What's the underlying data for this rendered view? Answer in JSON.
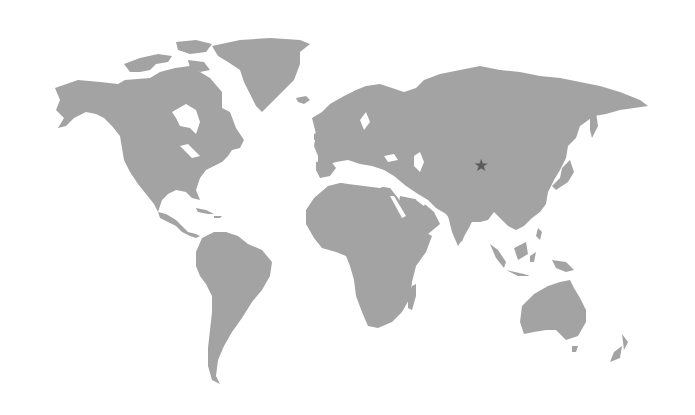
{
  "map": {
    "type": "world-map",
    "projection": "equirectangular-like",
    "colors": {
      "land": "#a3a3a3",
      "water": "#ffffff",
      "marker": "#5a5a5a"
    },
    "marker": {
      "icon": "star-icon",
      "glyph": "★",
      "x": 481,
      "y": 165,
      "region": "Central Asia (western China / Xinjiang area)"
    },
    "continents": [
      "North America",
      "Greenland",
      "South America",
      "Europe",
      "Africa",
      "Asia",
      "Australia",
      "New Zealand"
    ]
  }
}
